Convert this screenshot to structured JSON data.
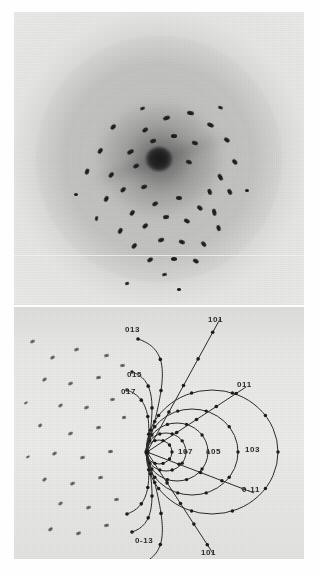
{
  "figure": {
    "panels": [
      {
        "name": "laue-photograph",
        "kind": "x-ray-diffraction-photograph"
      },
      {
        "name": "zone-index-diagram",
        "kind": "line-drawing"
      }
    ]
  },
  "photo": {
    "background_color": "#c9c9c7",
    "disc_color": "#a8a8a6",
    "spot_color": "#1e1e1e",
    "center_beamstop_color": "#1a1a1a",
    "spots": [
      [
        152,
        106,
        7,
        4,
        -20
      ],
      [
        131,
        118,
        6,
        3.5,
        -35
      ],
      [
        176,
        101,
        6.5,
        4,
        10
      ],
      [
        196,
        113,
        7,
        4,
        25
      ],
      [
        99,
        115,
        6,
        3.5,
        -45
      ],
      [
        213,
        128,
        6,
        3.5,
        35
      ],
      [
        86,
        139,
        6,
        3.5,
        -55
      ],
      [
        116,
        140,
        6.5,
        4,
        -30
      ],
      [
        160,
        124,
        6.5,
        4,
        0
      ],
      [
        181,
        131,
        6,
        3.5,
        18
      ],
      [
        139,
        129,
        6,
        3.5,
        -18
      ],
      [
        221,
        150,
        6,
        3.5,
        48
      ],
      [
        73,
        160,
        5.5,
        3.5,
        -70
      ],
      [
        97,
        163,
        6,
        3.5,
        -50
      ],
      [
        122,
        154,
        6,
        3.5,
        -28
      ],
      [
        206,
        165,
        6.5,
        4,
        60
      ],
      [
        196,
        180,
        6,
        3.5,
        70
      ],
      [
        175,
        150,
        5.5,
        3.5,
        20
      ],
      [
        92,
        187,
        6,
        3.5,
        -62
      ],
      [
        109,
        178,
        5.5,
        3.5,
        -45
      ],
      [
        130,
        175,
        5.5,
        3.5,
        -20
      ],
      [
        216,
        180,
        6,
        3.5,
        62
      ],
      [
        200,
        200,
        6.5,
        4,
        78
      ],
      [
        82,
        206,
        5,
        3,
        -78
      ],
      [
        118,
        201,
        6,
        3.5,
        -55
      ],
      [
        141,
        192,
        5.5,
        3.5,
        -30
      ],
      [
        165,
        186,
        5.5,
        3.5,
        5
      ],
      [
        186,
        196,
        6,
        3.5,
        40
      ],
      [
        106,
        219,
        6,
        3.5,
        -62
      ],
      [
        131,
        214,
        6,
        3.5,
        -42
      ],
      [
        152,
        205,
        6,
        3.5,
        -8
      ],
      [
        173,
        209,
        6,
        3.5,
        28
      ],
      [
        205,
        216,
        5.5,
        3.5,
        72
      ],
      [
        120,
        234,
        6,
        3.5,
        -50
      ],
      [
        147,
        228,
        6,
        3.5,
        -18
      ],
      [
        168,
        230,
        6,
        3.5,
        22
      ],
      [
        190,
        232,
        5.5,
        3.5,
        50
      ],
      [
        136,
        248,
        5.5,
        3.5,
        -32
      ],
      [
        160,
        247,
        5.5,
        3.5,
        0
      ],
      [
        182,
        249,
        5.5,
        3.5,
        30
      ],
      [
        150,
        262,
        5,
        3,
        -12
      ],
      [
        62,
        182,
        4,
        3,
        0
      ],
      [
        233,
        178,
        4,
        3,
        0
      ],
      [
        128,
        96,
        4.5,
        3,
        -20
      ],
      [
        206,
        95,
        4.5,
        3,
        20
      ],
      [
        165,
        277,
        4.5,
        3,
        0
      ],
      [
        113,
        271,
        4,
        2.5,
        -20
      ]
    ]
  },
  "diagram": {
    "background_color": "#e8e8e6",
    "ink_color": "#2b2b2b",
    "convergence_point": [
      133,
      145
    ],
    "labels": [
      {
        "name": "label-013",
        "text": "013",
        "x": 111,
        "y": 18
      },
      {
        "name": "label-101-top",
        "text": "101",
        "x": 194,
        "y": 8
      },
      {
        "name": "label-015",
        "text": "015",
        "x": 113,
        "y": 63
      },
      {
        "name": "label-017",
        "text": "017",
        "x": 107,
        "y": 80
      },
      {
        "name": "label-011",
        "text": "011",
        "x": 223,
        "y": 73
      },
      {
        "name": "label-107",
        "text": "107",
        "x": 164,
        "y": 140
      },
      {
        "name": "label-105",
        "text": "105",
        "x": 192,
        "y": 140
      },
      {
        "name": "label-103",
        "text": "103",
        "x": 231,
        "y": 138
      },
      {
        "name": "label-0-11",
        "text": "0-11",
        "x": 228,
        "y": 178
      },
      {
        "name": "label-0-13",
        "text": "0-13",
        "x": 121,
        "y": 229
      },
      {
        "name": "label-101-bottom",
        "text": "101",
        "x": 187,
        "y": 241
      }
    ],
    "zone_circles": [
      {
        "name": "zone-103",
        "cx": 198,
        "cy": 145,
        "rx": 66,
        "ry": 62
      },
      {
        "name": "zone-105",
        "cx": 178,
        "cy": 145,
        "rx": 46,
        "ry": 43
      },
      {
        "name": "zone-107",
        "cx": 163,
        "cy": 145,
        "rx": 31,
        "ry": 29
      },
      {
        "name": "zone-109",
        "cx": 152,
        "cy": 145,
        "rx": 20,
        "ry": 19
      },
      {
        "name": "zone-1011",
        "cx": 145,
        "cy": 145,
        "rx": 13,
        "ry": 12
      }
    ],
    "zone_arcs": [
      {
        "name": "arc-013",
        "d": "M133,145 C150,78 160,44 124,32"
      },
      {
        "name": "arc-015",
        "d": "M133,145 C142,96 140,72 118,65"
      },
      {
        "name": "arc-017",
        "d": "M133,145 C138,110 133,90 113,83"
      },
      {
        "name": "arc-0-13",
        "d": "M133,145 C150,212 160,246 124,258"
      },
      {
        "name": "arc-0-15",
        "d": "M133,145 C142,194 140,218 118,225"
      },
      {
        "name": "arc-0-17",
        "d": "M133,145 C138,180 133,200 113,207"
      }
    ],
    "zone_lines": [
      {
        "name": "line-101-top",
        "x1": 133,
        "y1": 145,
        "x2": 206,
        "y2": 12
      },
      {
        "name": "line-011",
        "x1": 133,
        "y1": 145,
        "x2": 232,
        "y2": 80
      },
      {
        "name": "line-0-11",
        "x1": 133,
        "y1": 145,
        "x2": 240,
        "y2": 186
      },
      {
        "name": "line-101-bottom",
        "x1": 133,
        "y1": 145,
        "x2": 200,
        "y2": 248
      }
    ],
    "scatter_spots": [
      [
        18,
        34,
        5,
        3,
        -28
      ],
      [
        38,
        50,
        5,
        3,
        -32
      ],
      [
        62,
        42,
        5,
        3,
        -20
      ],
      [
        92,
        48,
        5,
        3,
        -14
      ],
      [
        30,
        72,
        5,
        3,
        -38
      ],
      [
        56,
        76,
        5,
        3,
        -26
      ],
      [
        84,
        70,
        5,
        3,
        -12
      ],
      [
        108,
        58,
        5,
        3,
        -8
      ],
      [
        46,
        98,
        5,
        3,
        -34
      ],
      [
        72,
        100,
        5,
        3,
        -22
      ],
      [
        98,
        92,
        5,
        3,
        -10
      ],
      [
        26,
        118,
        4,
        2.6,
        -40
      ],
      [
        56,
        126,
        5,
        3,
        -26
      ],
      [
        84,
        120,
        5,
        3,
        -14
      ],
      [
        40,
        146,
        5,
        3,
        -32
      ],
      [
        68,
        150,
        5,
        3,
        -18
      ],
      [
        96,
        144,
        5,
        3,
        -6
      ],
      [
        30,
        172,
        5,
        3,
        -40
      ],
      [
        58,
        176,
        5,
        3,
        -26
      ],
      [
        86,
        170,
        5,
        3,
        -12
      ],
      [
        46,
        196,
        5,
        3,
        -34
      ],
      [
        74,
        200,
        5,
        3,
        -20
      ],
      [
        102,
        192,
        5,
        3,
        -8
      ],
      [
        36,
        222,
        4.5,
        2.8,
        -38
      ],
      [
        64,
        226,
        4.5,
        2.8,
        -24
      ],
      [
        92,
        218,
        4.5,
        2.8,
        -12
      ],
      [
        12,
        96,
        3.5,
        2.4,
        -30
      ],
      [
        14,
        150,
        3.5,
        2.4,
        -30
      ],
      [
        110,
        110,
        4,
        2.6,
        -10
      ]
    ]
  }
}
